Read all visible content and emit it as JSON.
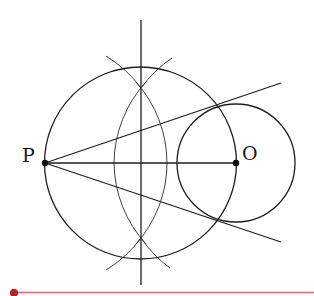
{
  "diagram": {
    "points": [
      {
        "id": "P",
        "label": "P"
      },
      {
        "id": "O",
        "label": "O"
      }
    ],
    "elements": [
      "circle centered at O",
      "circle with diameter PO",
      "perpendicular bisector of PO",
      "construction arcs centered at P and O",
      "segment PO",
      "tangent line from P (upper)",
      "tangent line from P (lower)"
    ],
    "colors": {
      "ink": "#1e1e1e",
      "accent_line": "#e06a6a",
      "accent_dot": "#b32525"
    }
  }
}
